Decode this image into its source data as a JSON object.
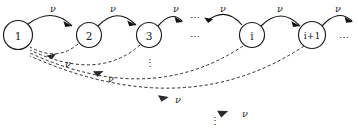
{
  "figure": {
    "kind": "transition-rate-diagram",
    "width": 358,
    "height": 134,
    "background_color": "#ffffff",
    "ink_color": "#1a1a1a",
    "dashed_color": "#2b2b2b"
  },
  "nodes": [
    {
      "id": "n1",
      "label": "1",
      "cx": 18,
      "cy": 35,
      "r": 14.5
    },
    {
      "id": "n2",
      "label": "2",
      "cx": 89,
      "cy": 35,
      "r": 12.5
    },
    {
      "id": "n3",
      "label": "3",
      "cx": 149,
      "cy": 35,
      "r": 12.5
    },
    {
      "id": "ni",
      "label": "i",
      "cx": 252,
      "cy": 35,
      "r": 12.5
    },
    {
      "id": "nip1",
      "label": "i+1",
      "cx": 312,
      "cy": 35,
      "r": 13.5
    }
  ],
  "forward_rate_labels": [
    {
      "text": "ν",
      "x": 53,
      "y": 8
    },
    {
      "text": "ν",
      "x": 113,
      "y": 8
    },
    {
      "text": "ν",
      "x": 176,
      "y": 8
    },
    {
      "text": "ν",
      "x": 223,
      "y": 8
    },
    {
      "text": "ν",
      "x": 280,
      "y": 8
    },
    {
      "text": "ν",
      "x": 338,
      "y": 8
    }
  ],
  "backward_rate_labels": [
    {
      "text": "ν",
      "x": 68,
      "y": 63
    },
    {
      "text": "ν",
      "x": 111,
      "y": 78
    },
    {
      "text": "ν",
      "x": 178,
      "y": 99
    },
    {
      "text": "ν",
      "x": 245,
      "y": 113
    }
  ],
  "ellipses": [
    {
      "id": "ell-top-mid",
      "text": "⋯",
      "x": 196,
      "y": 17,
      "orientation": "horizontal"
    },
    {
      "id": "ell-mid-row",
      "text": "⋯",
      "x": 196,
      "y": 36,
      "orientation": "horizontal"
    },
    {
      "id": "ell-right-row",
      "text": "⋯",
      "x": 345,
      "y": 37,
      "orientation": "horizontal"
    },
    {
      "id": "ell-under-n3",
      "text": "⋮",
      "x": 150,
      "y": 62,
      "orientation": "vertical"
    },
    {
      "id": "ell-bottom",
      "text": "⋮",
      "x": 215,
      "y": 120,
      "orientation": "vertical"
    }
  ],
  "legend": {
    "solid_meaning": "forward transition at rate nu",
    "dashed_meaning": "return transition to state 1 at rate nu"
  }
}
